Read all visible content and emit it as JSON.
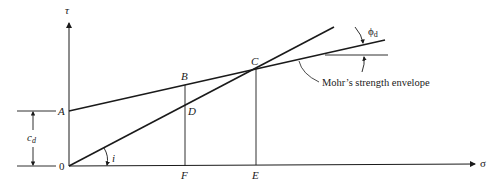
{
  "figure": {
    "type": "mohr-strength-envelope-diagram",
    "axes": {
      "y_label": "τ",
      "x_label": "σ",
      "origin_label": "0"
    },
    "points": {
      "A": "A",
      "B": "B",
      "C": "C",
      "D": "D",
      "E": "E",
      "F": "F"
    },
    "dimensions": {
      "cohesion_label": "c",
      "cohesion_subscript": "d"
    },
    "angles": {
      "friction_angle_label": "ϕ",
      "friction_angle_subscript": "d",
      "inclination_label": "i"
    },
    "annotation": "Mohr’s strength envelope",
    "colors": {
      "line": "#1a1a1a",
      "background": "#ffffff"
    }
  }
}
